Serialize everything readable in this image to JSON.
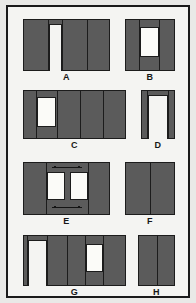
{
  "sheet": {
    "title": "Wall panel configuration plate",
    "background_color": "#e9e9e7",
    "frame_color": "#1a1a1a",
    "plate_color": "#f4f4f2",
    "wall_fill_color": "#5b5b5b",
    "wall_outline_color": "#1c1c1c",
    "opening_fill_color": "#fbfbf8"
  },
  "figures": [
    {
      "id": "a",
      "label": "A",
      "description": "Wide wall with doorway near left, open at bottom; three panel seams",
      "openings": {
        "doors": 1,
        "windows": 0
      },
      "panel_seams": 3
    },
    {
      "id": "b",
      "label": "B",
      "description": "Narrow wall with centered window; two panel seams",
      "openings": {
        "doors": 0,
        "windows": 1
      },
      "panel_seams": 2
    },
    {
      "id": "c",
      "label": "C",
      "description": "Wide wall with window near left; four panel seams",
      "openings": {
        "doors": 0,
        "windows": 1
      },
      "panel_seams": 4
    },
    {
      "id": "d",
      "label": "D",
      "description": "Narrow wall, doorway occupying most of the width, open at bottom",
      "openings": {
        "doors": 1,
        "windows": 0
      },
      "panel_seams": 1
    },
    {
      "id": "e",
      "label": "E",
      "description": "Wide wall with two centered windows and dimension arrow marks above and below",
      "openings": {
        "doors": 0,
        "windows": 2
      },
      "panel_seams": 2,
      "annotations": [
        "top-dimension-arrows",
        "bottom-dimension-arrows"
      ]
    },
    {
      "id": "f",
      "label": "F",
      "description": "Solid wall, no openings; one panel seam",
      "openings": {
        "doors": 0,
        "windows": 0
      },
      "panel_seams": 1
    },
    {
      "id": "g",
      "label": "G",
      "description": "Wide wall with doorway at left open at bottom and window right of centre",
      "openings": {
        "doors": 1,
        "windows": 1
      },
      "panel_seams": 3
    },
    {
      "id": "h",
      "label": "H",
      "description": "Narrow solid wall, no openings; one panel seam",
      "openings": {
        "doors": 0,
        "windows": 0
      },
      "panel_seams": 1
    }
  ]
}
